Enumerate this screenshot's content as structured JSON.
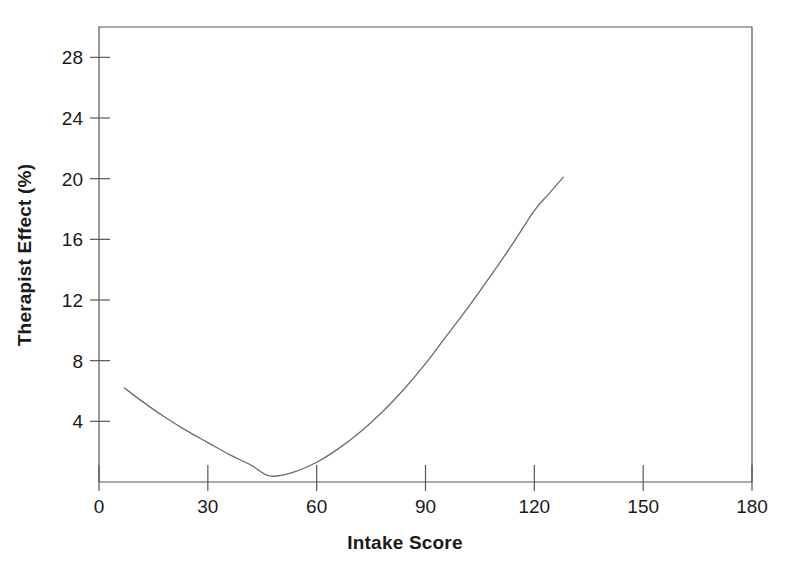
{
  "chart_data": {
    "type": "line",
    "title": "",
    "xlabel": "Intake Score",
    "ylabel": "Therapist Effect (%)",
    "xlim": [
      0,
      180
    ],
    "ylim": [
      0,
      30
    ],
    "xticks": [
      0,
      30,
      60,
      90,
      120,
      150,
      180
    ],
    "xtick_labels": [
      "0",
      "30",
      "60",
      "90",
      "120",
      "150",
      "180"
    ],
    "yticks": [
      4,
      8,
      12,
      16,
      20,
      24,
      28
    ],
    "ytick_labels": [
      "4",
      "8",
      "12",
      "16",
      "20",
      "24",
      "28"
    ],
    "grid": false,
    "legend": false,
    "series": [
      {
        "name": "Therapist Effect",
        "color": "#6b6b6b",
        "x": [
          7,
          12,
          18,
          24,
          30,
          36,
          42,
          47,
          53,
          60,
          66,
          72,
          78,
          84,
          90,
          96,
          102,
          108,
          114,
          120,
          124,
          128
        ],
        "y": [
          6.2,
          5.3,
          4.3,
          3.4,
          2.6,
          1.8,
          1.1,
          0.4,
          0.6,
          1.3,
          2.2,
          3.3,
          4.6,
          6.1,
          7.8,
          9.7,
          11.6,
          13.6,
          15.7,
          17.9,
          19.0,
          20.1
        ]
      }
    ],
    "annotations": [],
    "axis_color": "#555555",
    "text_color": "#1a1a1a",
    "background": "#ffffff"
  },
  "figure": {
    "plot_left_px": 99,
    "plot_right_px": 752,
    "plot_top_px": 27,
    "plot_bottom_px": 482
  }
}
